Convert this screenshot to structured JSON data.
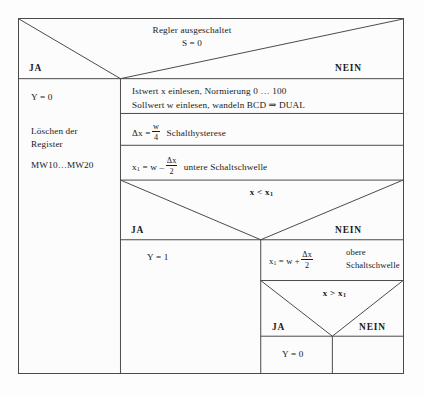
{
  "diagram": {
    "kind": "nassi-shneiderman-struktogramm",
    "background_color": "#fdfdfd",
    "line_color": "#4a4a4a",
    "text_color": "#1a1a1a"
  },
  "decision_top": {
    "condition_line1": "Regler ausgeschaltet",
    "condition_line2": "S = 0",
    "yes_label": "JA",
    "no_label": "NEIN"
  },
  "yes_branch_top": {
    "line1": "Y = 0",
    "line2a": "Löschen der",
    "line2b": "Register",
    "line3": "MW10…MW20"
  },
  "no_branch_top": {
    "block_read": {
      "line1": "Istwert x einlesen, Normierung 0 … 100",
      "line2": "Sollwert w einlesen, wandeln BCD ⇒ DUAL"
    },
    "block_hysterese": {
      "lhs": "Δx =",
      "numerator": "w",
      "denominator": "4",
      "comment": "Schalthysterese"
    },
    "block_untere": {
      "lhs_a": "x",
      "lhs_sub": "1",
      "lhs_b": "= w –",
      "numerator": "Δx",
      "denominator": "2",
      "comment": "untere Schaltschwelle"
    }
  },
  "decision_lower": {
    "condition_a": "x < x",
    "condition_sub": "1",
    "yes_label": "JA",
    "no_label": "NEIN"
  },
  "yes_branch_lower": {
    "statement": "Y = 1"
  },
  "no_branch_lower": {
    "block_obere": {
      "lhs_a": "x",
      "lhs_sub": "1",
      "lhs_b": "= w +",
      "numerator": "Δx",
      "denominator": "2",
      "comment_line1": "obere",
      "comment_line2": "Schaltschwelle"
    },
    "decision_inner": {
      "condition_a": "x > x",
      "condition_sub": "1",
      "yes_label": "JA",
      "no_label": "NEIN"
    },
    "yes_inner": {
      "statement": "Y = 0"
    },
    "no_inner": {
      "statement": ""
    }
  }
}
